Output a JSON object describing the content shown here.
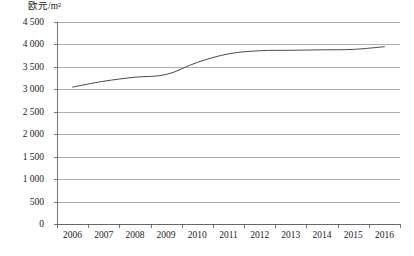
{
  "chart_data": {
    "type": "line",
    "title": "",
    "ylabel": "欧元/m²",
    "xlabel": "",
    "categories": [
      "2006",
      "2007",
      "2008",
      "2009",
      "2010",
      "2011",
      "2012",
      "2013",
      "2014",
      "2015",
      "2016"
    ],
    "x": [
      2006,
      2007,
      2008,
      2009,
      2010,
      2011,
      2012,
      2013,
      2014,
      2015,
      2016
    ],
    "series": [
      {
        "name": "欧元/m²",
        "values": [
          3050,
          3180,
          3270,
          3330,
          3600,
          3790,
          3860,
          3870,
          3880,
          3890,
          3950
        ],
        "color": "#4a4a4a"
      }
    ],
    "ylim": [
      0,
      4500
    ],
    "ytick_values": [
      0,
      500,
      1000,
      1500,
      2000,
      2500,
      3000,
      3500,
      4000,
      4500
    ],
    "ytick_labels": [
      "0",
      "500",
      "1 000",
      "1 500",
      "2 000",
      "2 500",
      "3 000",
      "3 500",
      "4 000",
      "4 500"
    ],
    "grid": true,
    "legend": "none",
    "gridline_color": "#8c8c8c",
    "axis_color": "#555555"
  }
}
